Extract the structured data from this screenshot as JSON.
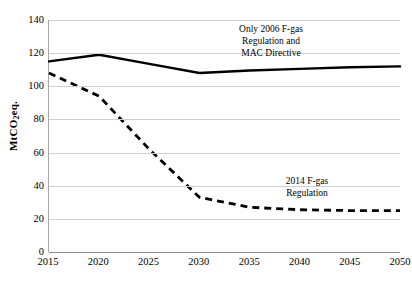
{
  "chart_data": {
    "type": "line",
    "title": "",
    "xlabel": "",
    "ylabel": "MtCO2eq.",
    "ylabel_parts": {
      "prefix": "MtCO",
      "sub": "2",
      "suffix": "eq."
    },
    "x": [
      2015,
      2020,
      2025,
      2030,
      2035,
      2040,
      2045,
      2050
    ],
    "categories": [
      "2015",
      "2020",
      "2025",
      "2030",
      "2035",
      "2040",
      "2045",
      "2050"
    ],
    "xlim": [
      2015,
      2050
    ],
    "ylim": [
      0,
      140
    ],
    "ytick_labels": [
      "0",
      "20",
      "40",
      "60",
      "80",
      "100",
      "120",
      "140"
    ],
    "ytick_values": [
      0,
      20,
      40,
      60,
      80,
      100,
      120,
      140
    ],
    "grid": true,
    "grid_axis": "y",
    "legend": "none (inline annotations)",
    "series": [
      {
        "name": "Only 2006 F-gas Regulation and MAC Directive",
        "style": "solid",
        "color": "#000000",
        "values": [
          115,
          119,
          113.5,
          108,
          109.5,
          110.5,
          111.5,
          112
        ]
      },
      {
        "name": "2014 F-gas Regulation",
        "style": "dashed",
        "color": "#000000",
        "values": [
          108,
          94,
          62,
          33,
          27,
          25.5,
          25,
          25
        ]
      }
    ],
    "annotations": [
      {
        "id": "annotation-baseline",
        "target_series": "Only 2006 F-gas Regulation and MAC Directive",
        "lines": [
          "Only 2006 F-gas",
          "Regulation and",
          "MAC Directive"
        ]
      },
      {
        "id": "annotation-regulation",
        "target_series": "2014 F-gas Regulation",
        "lines": [
          "2014 F-gas",
          "Regulation"
        ]
      }
    ]
  },
  "colors": {
    "series_line": "#000000",
    "gridline": "#cfcfcf",
    "axis": "#8c8c8c",
    "background": "#ffffff",
    "text": "#000000"
  }
}
